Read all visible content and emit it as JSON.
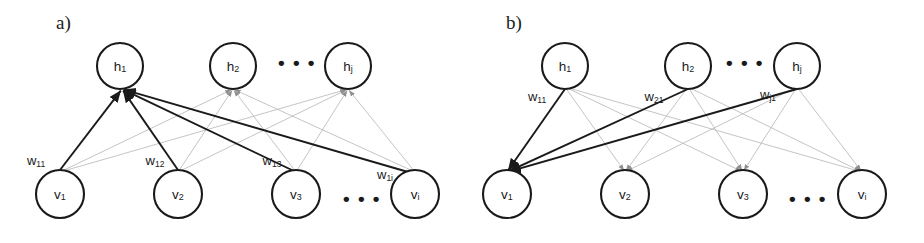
{
  "figure": {
    "colors": {
      "stroke": "#1a1a1a",
      "bold_edge": "#1a1a1a",
      "faint_edge": "#b9b9b9",
      "background": "#ffffff"
    }
  },
  "panels": [
    {
      "id": "a",
      "label": "a)",
      "label_pos": {
        "x": 56,
        "y": 25
      },
      "description": "Visible-to-hidden weights into h1",
      "hidden_nodes": [
        {
          "name": "h",
          "sub": "1",
          "x": 120,
          "y": 66,
          "r": 23
        },
        {
          "name": "h",
          "sub": "2",
          "x": 233,
          "y": 66,
          "r": 23
        },
        {
          "name": "h",
          "sub": "j",
          "x": 348,
          "y": 66,
          "r": 23
        }
      ],
      "hidden_ellipsis": {
        "text": "• • •",
        "x": 297,
        "y": 64
      },
      "visible_nodes": [
        {
          "name": "v",
          "sub": "1",
          "x": 60,
          "y": 194,
          "r": 24
        },
        {
          "name": "v",
          "sub": "2",
          "x": 178,
          "y": 194,
          "r": 24
        },
        {
          "name": "v",
          "sub": "3",
          "x": 296,
          "y": 194,
          "r": 24
        },
        {
          "name": "v",
          "sub": "i",
          "x": 415,
          "y": 194,
          "r": 24
        }
      ],
      "visible_ellipsis": {
        "text": "• • •",
        "x": 362,
        "y": 200
      },
      "weight_labels": [
        {
          "name": "w",
          "sub": "11",
          "x": 36,
          "y": 162
        },
        {
          "name": "w",
          "sub": "12",
          "x": 155,
          "y": 162
        },
        {
          "name": "w",
          "sub": "13",
          "x": 272,
          "y": 162
        },
        {
          "name": "w",
          "sub": "1i",
          "x": 385,
          "y": 176
        }
      ],
      "target_node": {
        "x": 122,
        "y": 89
      },
      "bold_edges_from": [
        {
          "x": 60,
          "y": 170
        },
        {
          "x": 178,
          "y": 170
        },
        {
          "x": 296,
          "y": 172
        },
        {
          "x": 415,
          "y": 174
        }
      ],
      "faint_targets": [
        {
          "x": 233,
          "y": 89
        },
        {
          "x": 348,
          "y": 89
        }
      ]
    },
    {
      "id": "b",
      "label": "b)",
      "label_pos": {
        "x": 506,
        "y": 25
      },
      "description": "Hidden-to-visible weights into v1",
      "hidden_nodes": [
        {
          "name": "h",
          "sub": "1",
          "x": 565,
          "y": 66,
          "r": 23
        },
        {
          "name": "h",
          "sub": "2",
          "x": 688,
          "y": 66,
          "r": 23
        },
        {
          "name": "h",
          "sub": "j",
          "x": 797,
          "y": 66,
          "r": 23
        }
      ],
      "hidden_ellipsis": {
        "text": "• • •",
        "x": 745,
        "y": 64
      },
      "visible_nodes": [
        {
          "name": "v",
          "sub": "1",
          "x": 507,
          "y": 194,
          "r": 24
        },
        {
          "name": "v",
          "sub": "2",
          "x": 625,
          "y": 194,
          "r": 24
        },
        {
          "name": "v",
          "sub": "3",
          "x": 743,
          "y": 194,
          "r": 24
        },
        {
          "name": "v",
          "sub": "i",
          "x": 862,
          "y": 194,
          "r": 24
        }
      ],
      "visible_ellipsis": {
        "text": "• • •",
        "x": 808,
        "y": 200
      },
      "weight_labels": [
        {
          "name": "w",
          "sub": "11",
          "x": 537,
          "y": 98
        },
        {
          "name": "w",
          "sub": "21",
          "x": 654,
          "y": 98
        },
        {
          "name": "w",
          "sub": "j1",
          "x": 768,
          "y": 96
        }
      ],
      "target_node": {
        "x": 507,
        "y": 172
      },
      "bold_edges_from": [
        {
          "x": 565,
          "y": 89
        },
        {
          "x": 688,
          "y": 89
        },
        {
          "x": 797,
          "y": 89
        }
      ],
      "faint_targets": [
        {
          "x": 625,
          "y": 172
        },
        {
          "x": 743,
          "y": 172
        },
        {
          "x": 862,
          "y": 172
        }
      ]
    }
  ]
}
